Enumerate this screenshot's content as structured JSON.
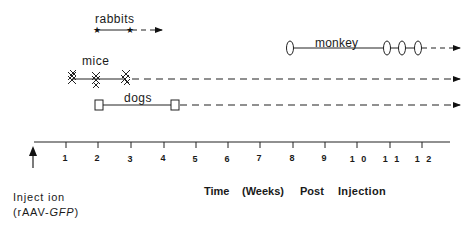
{
  "diagram": {
    "type": "timeline",
    "series": [
      {
        "name": "rabbits",
        "marker": "star",
        "marker_weeks": [
          2,
          3
        ],
        "continues": true
      },
      {
        "name": "monkey",
        "marker": "oval",
        "marker_weeks": [
          8,
          11,
          11.5,
          12
        ],
        "continues": true
      },
      {
        "name": "mice",
        "marker": "cross-cluster",
        "marker_weeks": [
          1.2,
          2,
          2.9
        ],
        "continues": true
      },
      {
        "name": "dogs",
        "marker": "square",
        "marker_weeks": [
          2,
          4.4
        ],
        "continues": true
      }
    ],
    "axis": {
      "ticks": [
        "1",
        "2",
        "3",
        "4",
        "5",
        "6",
        "7",
        "8",
        "9",
        "1 0",
        "1 1",
        "1 2"
      ],
      "label_parts": [
        "Time",
        "(Weeks)",
        "Post",
        "Injection"
      ]
    },
    "injection": {
      "line1": "Inject ion",
      "line2_prefix": "(rAAV-",
      "line2_italic": "GFP",
      "line2_suffix": ")"
    }
  }
}
